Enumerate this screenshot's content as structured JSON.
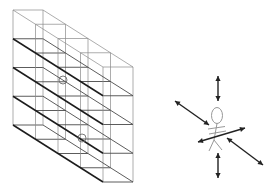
{
  "figure": {
    "colors": {
      "background": "#ffffff",
      "heavy_line": "#1c1c1c",
      "light_line": "#8a8a8a",
      "figure_line": "#8c8c8c",
      "arrow": "#222222"
    }
  },
  "rack": {
    "origin": [
      13,
      10
    ],
    "front_width": 30,
    "slice_offset": [
      22.5,
      14.25
    ],
    "slice_count": 4,
    "level_ys": [
      0,
      28.75,
      57.5,
      86.25,
      115
    ],
    "circled_positions": [
      {
        "cx": 63,
        "cy": 80,
        "r": 4
      },
      {
        "cx": 82,
        "cy": 138,
        "r": 4
      }
    ]
  },
  "person": {
    "head": {
      "cx": 217,
      "cy": 115.5,
      "rx": 5.5,
      "ry": 8
    },
    "body": [
      [
        217,
        123.5
      ],
      [
        214,
        140
      ]
    ],
    "arms": [
      [
        [
          208,
          129
        ],
        [
          225,
          126.5
        ]
      ],
      [
        [
          209,
          134
        ],
        [
          226,
          131
        ]
      ]
    ],
    "legs": [
      [
        [
          214,
          140
        ],
        [
          209,
          151
        ]
      ],
      [
        [
          214,
          140
        ],
        [
          222,
          150
        ]
      ]
    ]
  },
  "arrows": [
    {
      "name": "up-down-arrow-top",
      "from": [
        218,
        76
      ],
      "to": [
        218,
        101
      ]
    },
    {
      "name": "diagonal-arrow-upper-left",
      "from": [
        175,
        101
      ],
      "to": [
        209,
        125
      ]
    },
    {
      "name": "horizontal-arrow-through-body",
      "from": [
        198,
        142
      ],
      "to": [
        245,
        128
      ]
    },
    {
      "name": "diagonal-arrow-lower-right",
      "from": [
        227,
        138
      ],
      "to": [
        263,
        165
      ]
    },
    {
      "name": "up-down-arrow-bottom",
      "from": [
        218,
        153
      ],
      "to": [
        218,
        178
      ]
    }
  ]
}
